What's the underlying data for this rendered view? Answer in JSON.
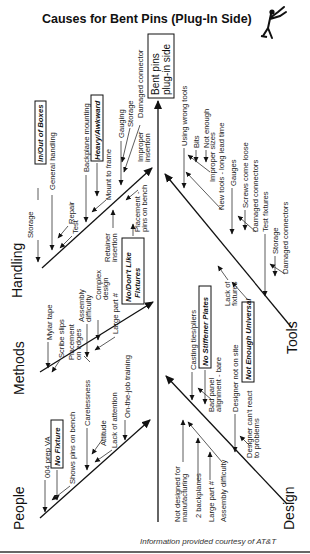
{
  "title": "Causes for Bent Pins (Plug-In Side)",
  "effect": {
    "line1": "Bent pins",
    "line2": "plug-in side"
  },
  "credit": "Information provided courtesy of AT&T",
  "icon": "running-figure-logo",
  "categories": {
    "handling": {
      "label": "Handling",
      "boxed": [
        "In/Out of Boxes",
        "Heavy/Awkward",
        "No/Don't Like",
        "Fixtures"
      ],
      "causes": [
        "Storage",
        "General handling",
        "Repair",
        "Test",
        "Backplane mounting",
        "Mount to frame",
        "Gauging",
        "Storage",
        "Damaged connector",
        "Improper",
        "insertion",
        "Retainer",
        "insertion",
        "Placement -",
        "pins on bench"
      ]
    },
    "methods": {
      "label": "Methods",
      "causes": [
        "Mylar tape",
        "Scribe slips",
        "Placement",
        "on edges",
        "Assembly",
        "difficulty",
        "Complex",
        "design",
        "Large part #"
      ]
    },
    "people": {
      "label": "People",
      "boxed": [
        "No Fixture"
      ],
      "causes": [
        "004 prep VA",
        "Shows pins on bench",
        "Carelessness",
        "Attitude",
        "Lack of attention",
        "On-the-job training"
      ]
    },
    "tools": {
      "label": "Tools",
      "boxed": [
        "Not Enough Universal"
      ],
      "causes": [
        "Using wrong tools",
        "Bits",
        "Not enough",
        "Improper sizes",
        "New tools - long lead time",
        "Gauges",
        "Screws come loose",
        "Damaged connectors",
        "Test fixtures",
        "Storage",
        "Damaged connectors",
        "Lack of",
        "fixtures"
      ]
    },
    "design": {
      "label": "Design",
      "boxed": [
        "No Stiffener Plates"
      ],
      "causes": [
        "Casting ties/pliers",
        "Bad panel",
        "alignment - bare",
        "Designer not on site",
        "Designer can't react",
        "to problems",
        "Not designed for",
        "manufacturing",
        "2 backplanes",
        "Large part #",
        "Assembly difficulty"
      ]
    }
  }
}
